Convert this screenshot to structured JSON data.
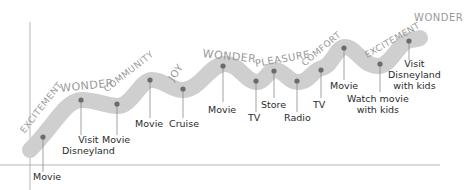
{
  "diagram": {
    "type": "emotional-journey-curve",
    "colors": {
      "band": "#cfcfcf",
      "dot": "#6b6b6b",
      "axis": "#aaaaaa",
      "emotion_text": "#9a9a9a",
      "label_text": "#2b2b2b"
    },
    "emotions": [
      {
        "text": "EXCITEMENT"
      },
      {
        "text": "WONDER"
      },
      {
        "text": "COMMUNITY"
      },
      {
        "text": "JOY"
      },
      {
        "text": "WONDER"
      },
      {
        "text": "PLEASURE"
      },
      {
        "text": "COMFORT"
      },
      {
        "text": "EXCITEMENT"
      },
      {
        "text": "WONDER"
      }
    ],
    "events": [
      {
        "label": "Movie"
      },
      {
        "label": "Visit\nDisneyland"
      },
      {
        "label": "Movie"
      },
      {
        "label": "Movie"
      },
      {
        "label": "Cruise"
      },
      {
        "label": "Movie"
      },
      {
        "label": "TV"
      },
      {
        "label": "Store"
      },
      {
        "label": "Radio"
      },
      {
        "label": "TV"
      },
      {
        "label": "Movie"
      },
      {
        "label": "Watch movie\nwith kids"
      },
      {
        "label": "Visit\nDisneyland\nwith kids"
      }
    ]
  }
}
